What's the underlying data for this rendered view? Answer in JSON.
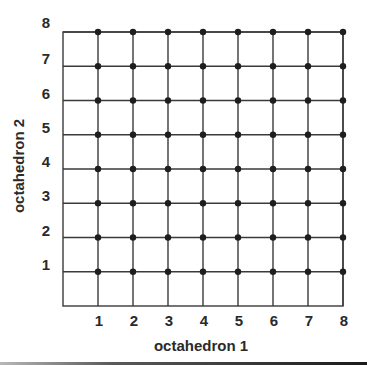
{
  "chart_data": {
    "type": "scatter",
    "title": "",
    "xlabel": "octahedron 1",
    "ylabel": "octahedron 2",
    "xlim": [
      0,
      8
    ],
    "ylim": [
      0,
      8
    ],
    "x_ticks": [
      1,
      2,
      3,
      4,
      5,
      6,
      7,
      8
    ],
    "y_ticks": [
      1,
      2,
      3,
      4,
      5,
      6,
      7,
      8
    ],
    "x_tick_labels": [
      "1",
      "2",
      "3",
      "4",
      "5",
      "6",
      "7",
      "8"
    ],
    "y_tick_labels": [
      "1",
      "2",
      "3",
      "4",
      "5",
      "6",
      "7",
      "8"
    ],
    "grid": true,
    "legend": null,
    "series": [
      {
        "name": "lattice points",
        "points": [
          [
            1,
            1
          ],
          [
            2,
            1
          ],
          [
            3,
            1
          ],
          [
            4,
            1
          ],
          [
            5,
            1
          ],
          [
            6,
            1
          ],
          [
            7,
            1
          ],
          [
            8,
            1
          ],
          [
            1,
            2
          ],
          [
            2,
            2
          ],
          [
            3,
            2
          ],
          [
            4,
            2
          ],
          [
            5,
            2
          ],
          [
            6,
            2
          ],
          [
            7,
            2
          ],
          [
            8,
            2
          ],
          [
            1,
            3
          ],
          [
            2,
            3
          ],
          [
            3,
            3
          ],
          [
            4,
            3
          ],
          [
            5,
            3
          ],
          [
            6,
            3
          ],
          [
            7,
            3
          ],
          [
            8,
            3
          ],
          [
            1,
            4
          ],
          [
            2,
            4
          ],
          [
            3,
            4
          ],
          [
            4,
            4
          ],
          [
            5,
            4
          ],
          [
            6,
            4
          ],
          [
            7,
            4
          ],
          [
            8,
            4
          ],
          [
            1,
            5
          ],
          [
            2,
            5
          ],
          [
            3,
            5
          ],
          [
            4,
            5
          ],
          [
            5,
            5
          ],
          [
            6,
            5
          ],
          [
            7,
            5
          ],
          [
            8,
            5
          ],
          [
            1,
            6
          ],
          [
            2,
            6
          ],
          [
            3,
            6
          ],
          [
            4,
            6
          ],
          [
            5,
            6
          ],
          [
            6,
            6
          ],
          [
            7,
            6
          ],
          [
            8,
            6
          ],
          [
            1,
            7
          ],
          [
            2,
            7
          ],
          [
            3,
            7
          ],
          [
            4,
            7
          ],
          [
            5,
            7
          ],
          [
            6,
            7
          ],
          [
            7,
            7
          ],
          [
            8,
            7
          ],
          [
            1,
            8
          ],
          [
            2,
            8
          ],
          [
            3,
            8
          ],
          [
            4,
            8
          ],
          [
            5,
            8
          ],
          [
            6,
            8
          ],
          [
            7,
            8
          ],
          [
            8,
            8
          ]
        ]
      }
    ]
  },
  "colors": {
    "line": "#3a3a3a",
    "point": "#1e1e1e",
    "text": "#2a2a2a",
    "background": "#ffffff"
  }
}
